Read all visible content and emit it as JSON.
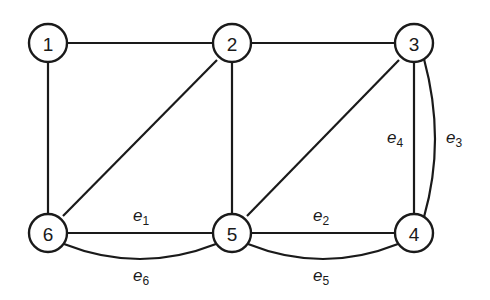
{
  "diagram": {
    "type": "undirected multigraph",
    "stroke_color": "#1a1a1a",
    "background": "#ffffff",
    "nodes": [
      {
        "id": "1",
        "label": "1",
        "x": 48,
        "y": 43
      },
      {
        "id": "2",
        "label": "2",
        "x": 232,
        "y": 43
      },
      {
        "id": "3",
        "label": "3",
        "x": 414,
        "y": 43
      },
      {
        "id": "4",
        "label": "4",
        "x": 414,
        "y": 233
      },
      {
        "id": "5",
        "label": "5",
        "x": 232,
        "y": 233
      },
      {
        "id": "6",
        "label": "6",
        "x": 48,
        "y": 233
      }
    ],
    "edges": [
      {
        "from": "1",
        "to": "2",
        "label": ""
      },
      {
        "from": "2",
        "to": "3",
        "label": ""
      },
      {
        "from": "1",
        "to": "6",
        "label": ""
      },
      {
        "from": "2",
        "to": "6",
        "label": ""
      },
      {
        "from": "2",
        "to": "5",
        "label": ""
      },
      {
        "from": "3",
        "to": "5",
        "label": ""
      },
      {
        "from": "6",
        "to": "5",
        "label": "e",
        "sub": "1"
      },
      {
        "from": "5",
        "to": "4",
        "label": "e",
        "sub": "2"
      },
      {
        "from": "3",
        "to": "4",
        "label": "e",
        "sub": "3",
        "curved": true
      },
      {
        "from": "3",
        "to": "4",
        "label": "e",
        "sub": "4"
      },
      {
        "from": "5",
        "to": "4",
        "label": "e",
        "sub": "5",
        "curved": true
      },
      {
        "from": "6",
        "to": "5",
        "label": "e",
        "sub": "6",
        "curved": true
      }
    ],
    "edge_labels": {
      "e1": {
        "base": "e",
        "sub": "1"
      },
      "e2": {
        "base": "e",
        "sub": "2"
      },
      "e3": {
        "base": "e",
        "sub": "3"
      },
      "e4": {
        "base": "e",
        "sub": "4"
      },
      "e5": {
        "base": "e",
        "sub": "5"
      },
      "e6": {
        "base": "e",
        "sub": "6"
      }
    }
  }
}
